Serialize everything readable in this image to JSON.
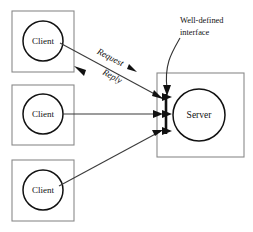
{
  "diagram": {
    "canvas": {
      "width": 253,
      "height": 232,
      "background": "#ffffff"
    },
    "colors": {
      "box_stroke": "#8a8a8a",
      "circle_stroke": "#111111",
      "line_stroke": "#3b3b3b",
      "interface_bar": "#111111",
      "text": "#111111"
    },
    "clients": [
      {
        "label": "Client",
        "box": {
          "x": 12,
          "y": 11,
          "w": 62,
          "h": 61
        },
        "circle": {
          "cx": 43,
          "cy": 41,
          "r": 20
        }
      },
      {
        "label": "Client",
        "box": {
          "x": 12,
          "y": 85,
          "w": 62,
          "h": 60
        },
        "circle": {
          "cx": 43,
          "cy": 114,
          "r": 20
        }
      },
      {
        "label": "Client",
        "box": {
          "x": 12,
          "y": 160,
          "w": 62,
          "h": 61
        },
        "circle": {
          "cx": 43,
          "cy": 190,
          "r": 20
        }
      }
    ],
    "server": {
      "label": "Server",
      "box": {
        "x": 157,
        "y": 73,
        "w": 87,
        "h": 84
      },
      "circle": {
        "cx": 199,
        "cy": 115,
        "r": 26
      }
    },
    "interface_bar": {
      "x": 166,
      "y1": 94,
      "y2": 134
    },
    "connections": [
      {
        "from": "client-1",
        "to": "server-interface",
        "labels": [
          "Request",
          "Reply"
        ],
        "x1": 60,
        "y1": 43,
        "x2": 163,
        "y2": 98,
        "bidirectional": true
      },
      {
        "from": "client-2",
        "to": "server-interface",
        "labels": [],
        "x1": 63,
        "y1": 114,
        "x2": 160,
        "y2": 114,
        "bidirectional": false
      },
      {
        "from": "client-3",
        "to": "server-interface",
        "labels": [],
        "x1": 59,
        "y1": 186,
        "x2": 162,
        "y2": 131,
        "bidirectional": false
      }
    ],
    "callout": {
      "lines": [
        "Well-defined",
        "interface"
      ],
      "text_x": 180,
      "line1_y": 21,
      "line2_y": 33,
      "curve": "M 180 38 C 172 52, 165 64, 166 90"
    },
    "request_label": {
      "text": "Request",
      "x": 110,
      "y": 59,
      "rotation": 28
    },
    "reply_label": {
      "text": "Reply",
      "x": 113,
      "y": 76,
      "rotation": 28
    }
  }
}
